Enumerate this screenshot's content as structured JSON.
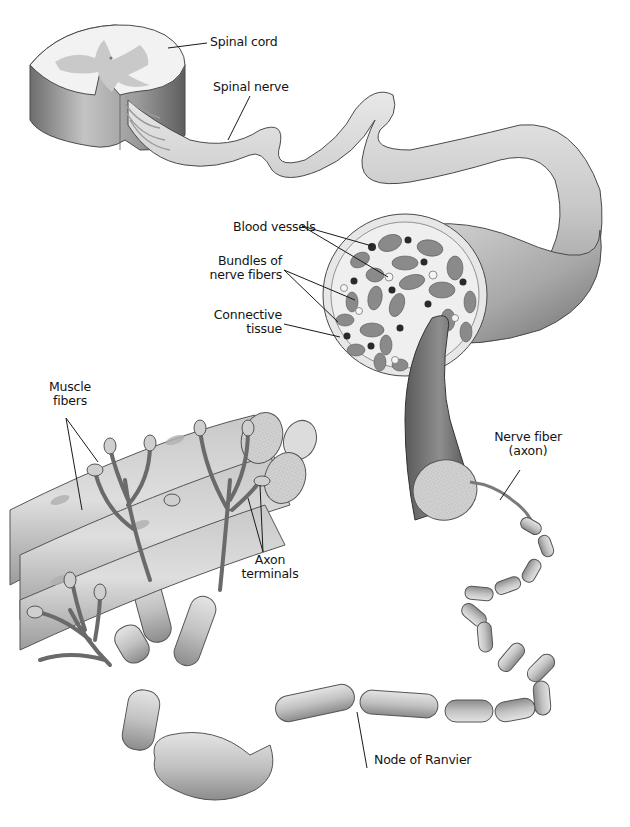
{
  "figure": {
    "background": "#ffffff",
    "palette": {
      "tissue_light": "#e6e6e6",
      "tissue_mid": "#bdbdbd",
      "tissue_dark": "#7a7a7a",
      "outline": "#4a4a4a",
      "vessel_dark": "#2a2a2a",
      "label_text": "#141414"
    }
  },
  "labels": {
    "spinal_cord": "Spinal cord",
    "spinal_nerve": "Spinal nerve",
    "blood_vessels": "Blood vessels",
    "bundles_line1": "Bundles of",
    "bundles_line2": "nerve fibers",
    "connective_line1": "Connective",
    "connective_line2": "tissue",
    "muscle_line1": "Muscle",
    "muscle_line2": "fibers",
    "nerve_fiber_line1": "Nerve fiber",
    "nerve_fiber_line2": "(axon)",
    "axon_line1": "Axon",
    "axon_line2": "terminals",
    "node_of_ranvier": "Node of Ranvier"
  }
}
